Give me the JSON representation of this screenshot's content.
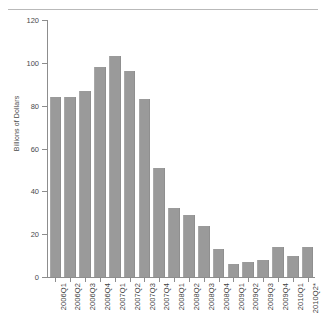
{
  "chart_data": {
    "type": "bar",
    "title": "",
    "subtitle": "",
    "xlabel": "",
    "ylabel": "Billions of Dollars",
    "ylim": [
      0,
      120
    ],
    "yticks": [
      0,
      20,
      40,
      60,
      80,
      100,
      120
    ],
    "grid": false,
    "legend": null,
    "bar_color": "#9a9a9a",
    "categories": [
      "2006Q1",
      "2006Q2",
      "2006Q3",
      "2006Q4",
      "2007Q1",
      "2007Q2",
      "2007Q3",
      "2007Q4",
      "2008Q1",
      "2008Q2",
      "2008Q3",
      "2008Q4",
      "2009Q1",
      "2009Q2",
      "2009Q3",
      "2009Q4",
      "2010Q1",
      "2010Q2*"
    ],
    "values": [
      84,
      84,
      87,
      98,
      103,
      96,
      83,
      51,
      32,
      29,
      24,
      13,
      6,
      7,
      8,
      14,
      10,
      14
    ],
    "footnote": "*"
  }
}
